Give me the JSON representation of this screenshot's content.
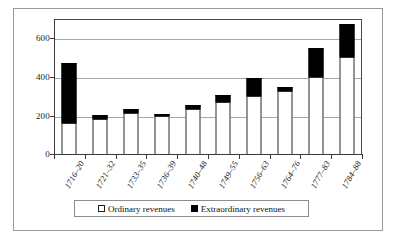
{
  "chart_data": {
    "type": "bar",
    "stacked": true,
    "title": "",
    "subtitle": "",
    "xlabel": "",
    "ylabel": "",
    "ylim": [
      0,
      700
    ],
    "yticks": [
      0,
      200,
      400,
      600
    ],
    "ytick_labels": [
      "0",
      "200",
      "400",
      "600"
    ],
    "grid": true,
    "grid_axis": "y",
    "legend_position": "bottom",
    "categories": [
      "1716–20",
      "1721–32",
      "1733–35",
      "1736–39",
      "1740–48",
      "1749–55",
      "1756–63",
      "1764–76",
      "1777–83",
      "1784–88"
    ],
    "series": [
      {
        "name": "Ordinary revenues",
        "color": "#ffffff",
        "values": [
          160,
          180,
          215,
          195,
          235,
          270,
          300,
          325,
          400,
          505
        ]
      },
      {
        "name": "Extraordinary revenues",
        "color": "#000000",
        "values": [
          310,
          20,
          20,
          8,
          18,
          35,
          95,
          20,
          150,
          170
        ]
      }
    ],
    "totals": [
      470,
      200,
      235,
      203,
      253,
      305,
      395,
      345,
      550,
      675
    ]
  },
  "legend": {
    "entries": [
      {
        "label": "Ordinary revenues",
        "swatch": "open-square-icon"
      },
      {
        "label": "Extraordinary  revenues",
        "swatch": "filled-square-icon"
      }
    ]
  }
}
